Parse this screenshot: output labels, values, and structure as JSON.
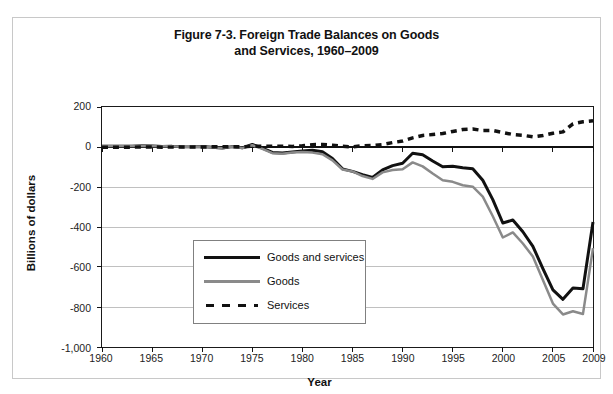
{
  "figure": {
    "title_line1": "Figure 7-3. Foreign Trade Balances on Goods",
    "title_line2": "and Services, 1960–2009"
  },
  "axes": {
    "y_title": "Billions of dollars",
    "x_title": "Year",
    "y_ticks": [
      "200",
      "0",
      "-200",
      "-400",
      "-600",
      "-800",
      "-1,000"
    ],
    "x_ticks": [
      "1960",
      "1965",
      "1970",
      "1975",
      "1980",
      "1985",
      "1990",
      "1995",
      "2000",
      "2005",
      "2009"
    ]
  },
  "legend": {
    "items": [
      {
        "label": "Goods and services",
        "style": "solid-black",
        "color": "#111111"
      },
      {
        "label": "Goods",
        "style": "solid-gray",
        "color": "#8a8a8a"
      },
      {
        "label": "Services",
        "style": "dashed-black",
        "color": "#111111"
      }
    ]
  },
  "chart_data": {
    "type": "line",
    "title": "Figure 7-3. Foreign Trade Balances on Goods and Services, 1960–2009",
    "xlabel": "Year",
    "ylabel": "Billions of dollars",
    "xlim": [
      1960,
      2009
    ],
    "ylim": [
      -1000,
      200
    ],
    "grid": true,
    "legend_position": "center-left-inside",
    "x": [
      1960,
      1961,
      1962,
      1963,
      1964,
      1965,
      1966,
      1967,
      1968,
      1969,
      1970,
      1971,
      1972,
      1973,
      1974,
      1975,
      1976,
      1977,
      1978,
      1979,
      1980,
      1981,
      1982,
      1983,
      1984,
      1985,
      1986,
      1987,
      1988,
      1989,
      1990,
      1991,
      1992,
      1993,
      1994,
      1995,
      1996,
      1997,
      1998,
      1999,
      2000,
      2001,
      2002,
      2003,
      2004,
      2005,
      2006,
      2007,
      2008,
      2009
    ],
    "series": [
      {
        "name": "Goods and services",
        "color": "#111111",
        "style": "solid",
        "width": 3,
        "values": [
          3.5,
          4.3,
          3.4,
          4.4,
          6.8,
          5.4,
          3.0,
          3.2,
          0.6,
          0.6,
          2.3,
          -1.4,
          -5.4,
          1.9,
          -4.3,
          12.4,
          -6.1,
          -27.2,
          -29.8,
          -24.6,
          -19.4,
          -16.2,
          -24.2,
          -57.8,
          -109.1,
          -121.9,
          -138.5,
          -151.7,
          -114.6,
          -93.1,
          -80.9,
          -31.1,
          -39.2,
          -70.3,
          -98.5,
          -96.4,
          -104.1,
          -108.3,
          -166.1,
          -263.2,
          -379.8,
          -365.1,
          -423.7,
          -496.9,
          -607.7,
          -714.2,
          -761.7,
          -705.4,
          -708.7,
          -374.9
        ]
      },
      {
        "name": "Goods",
        "color": "#8a8a8a",
        "style": "solid",
        "width": 2.5,
        "values": [
          4.9,
          5.6,
          4.5,
          5.2,
          6.8,
          5.0,
          3.8,
          3.8,
          0.6,
          0.6,
          2.6,
          -2.3,
          -6.4,
          0.9,
          -5.5,
          8.9,
          -9.5,
          -31.1,
          -33.9,
          -27.6,
          -25.5,
          -28.0,
          -36.5,
          -67.1,
          -112.5,
          -122.2,
          -145.1,
          -159.6,
          -127.0,
          -115.2,
          -111.0,
          -76.9,
          -96.9,
          -132.5,
          -165.8,
          -174.2,
          -191.3,
          -198.4,
          -248.2,
          -346.0,
          -452.4,
          -427.2,
          -482.3,
          -547.6,
          -665.4,
          -782.8,
          -837.3,
          -821.2,
          -834.7,
          -505.9
        ]
      },
      {
        "name": "Services",
        "color": "#111111",
        "style": "dashed",
        "width": 3.5,
        "values": [
          -1.4,
          -1.3,
          -1.1,
          -0.8,
          0.0,
          0.4,
          -0.8,
          -0.6,
          0.0,
          0.0,
          -0.3,
          0.9,
          1.0,
          1.0,
          1.2,
          3.5,
          3.4,
          3.9,
          4.1,
          3.0,
          6.1,
          11.8,
          12.3,
          9.3,
          3.4,
          0.3,
          6.6,
          7.9,
          12.4,
          22.1,
          30.1,
          45.8,
          57.7,
          62.2,
          67.3,
          77.8,
          87.2,
          90.1,
          82.1,
          82.8,
          72.6,
          62.1,
          58.6,
          50.7,
          57.7,
          68.6,
          75.6,
          115.8,
          126.0,
          131.0
        ]
      }
    ]
  }
}
